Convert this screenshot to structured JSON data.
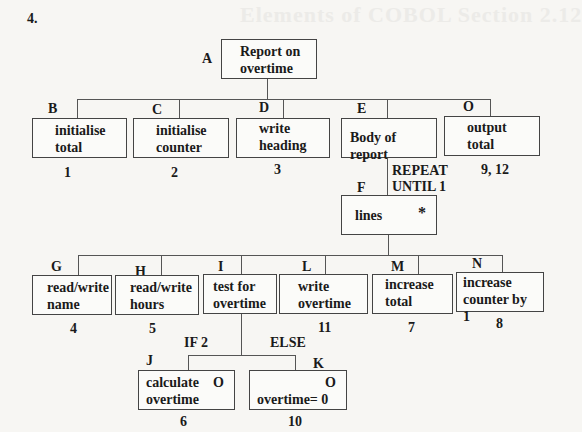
{
  "question_number": "4.",
  "ghost_heading": "Elements of COBOL Section 2.12",
  "nodes": {
    "A": {
      "letter": "A",
      "line1": "Report on",
      "line2": "overtime"
    },
    "B": {
      "letter": "B",
      "line1": "initialise",
      "line2": "total",
      "number": "1"
    },
    "C": {
      "letter": "C",
      "line1": "initialise",
      "line2": "counter",
      "number": "2"
    },
    "D": {
      "letter": "D",
      "line1": "write",
      "line2": "heading",
      "number": "3"
    },
    "E": {
      "letter": "E",
      "line1": "Body of report"
    },
    "O": {
      "letter": "O",
      "line1": "output",
      "line2": "total",
      "number": "9, 12"
    },
    "F": {
      "letter": "F",
      "line1": "lines",
      "marker": "*",
      "condition_line1": "REPEAT",
      "condition_line2": "UNTIL 1"
    },
    "G": {
      "letter": "G",
      "line1": "read/write",
      "line2": "name",
      "number": "4"
    },
    "H": {
      "letter": "H",
      "line1": "read/write",
      "line2": "hours",
      "number": "5"
    },
    "I": {
      "letter": "I",
      "line1": "test for",
      "line2": "overtime"
    },
    "L": {
      "letter": "L",
      "line1": "write",
      "line2": "overtime",
      "number": "11"
    },
    "M": {
      "letter": "M",
      "line1": "increase",
      "line2": "total",
      "number": "7"
    },
    "N": {
      "letter": "N",
      "line1": "increase",
      "line2": "counter by 1",
      "number": "8"
    },
    "J": {
      "letter": "J",
      "line1": "calculate",
      "line2": "overtime",
      "marker": "O",
      "number": "6",
      "condition": "IF 2"
    },
    "K": {
      "letter": "K",
      "line1": "overtime= 0",
      "marker": "O",
      "number": "10",
      "condition": "ELSE"
    }
  }
}
